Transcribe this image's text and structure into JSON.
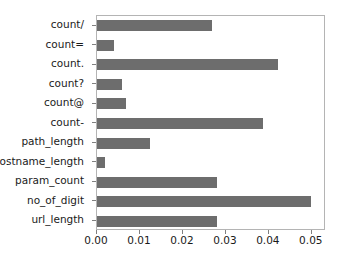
{
  "chart_data": {
    "type": "bar",
    "orientation": "horizontal",
    "title": "",
    "xlabel": "",
    "ylabel": "",
    "xlim": [
      0.0,
      0.0533
    ],
    "grid": false,
    "legend": null,
    "bar_color": "#6d6d6d",
    "frame_color": "#b4b4b4",
    "tick_label_color": "#1a1a1a",
    "xticks": [
      0.0,
      0.01,
      0.02,
      0.03,
      0.04,
      0.05
    ],
    "xtick_labels": [
      "0.00",
      "0.01",
      "0.02",
      "0.03",
      "0.04",
      "0.05"
    ],
    "categories": [
      "count/",
      "count=",
      "count.",
      "count?",
      "count@",
      "count-",
      "path_length",
      "hostname_length",
      "param_count",
      "no_of_digit",
      "url_length"
    ],
    "values": [
      0.0267,
      0.004,
      0.0421,
      0.0058,
      0.0068,
      0.0386,
      0.0123,
      0.0018,
      0.0279,
      0.0498,
      0.0279
    ]
  }
}
